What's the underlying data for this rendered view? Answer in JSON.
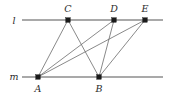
{
  "figure": {
    "type": "euclidean-geometry-diagram",
    "width": 170,
    "height": 95,
    "background_color": "#ffffff",
    "line_color": "#8c8c8c",
    "segment_color": "#6b6b6b",
    "point_color": "#1a1a1a",
    "label_color": "#2b2b2b"
  },
  "lines": [
    {
      "id": "l",
      "label": "l",
      "label_x": 14,
      "label_y": 24,
      "x1": 22,
      "y1": 20,
      "x2": 163,
      "y2": 20
    },
    {
      "id": "m",
      "label": "m",
      "label_x": 14,
      "label_y": 80,
      "x1": 22,
      "y1": 77,
      "x2": 163,
      "y2": 77
    }
  ],
  "points": [
    {
      "id": "A",
      "label": "A",
      "x": 38,
      "y": 77,
      "label_x": 38,
      "label_y": 92,
      "on_line": "m"
    },
    {
      "id": "B",
      "label": "B",
      "x": 99,
      "y": 77,
      "label_x": 99,
      "label_y": 92,
      "on_line": "m"
    },
    {
      "id": "C",
      "label": "C",
      "x": 68,
      "y": 20,
      "label_x": 68,
      "label_y": 12,
      "on_line": "l"
    },
    {
      "id": "D",
      "label": "D",
      "x": 114,
      "y": 20,
      "label_x": 114,
      "label_y": 12,
      "on_line": "l"
    },
    {
      "id": "E",
      "label": "E",
      "x": 145,
      "y": 20,
      "label_x": 145,
      "label_y": 12,
      "on_line": "l"
    }
  ],
  "segments": [
    {
      "id": "AC",
      "from": "A",
      "to": "C",
      "x1": 38,
      "y1": 77,
      "x2": 68,
      "y2": 20
    },
    {
      "id": "AD",
      "from": "A",
      "to": "D",
      "x1": 38,
      "y1": 77,
      "x2": 114,
      "y2": 20
    },
    {
      "id": "AE",
      "from": "A",
      "to": "E",
      "x1": 38,
      "y1": 77,
      "x2": 145,
      "y2": 20
    },
    {
      "id": "BC",
      "from": "B",
      "to": "C",
      "x1": 99,
      "y1": 77,
      "x2": 68,
      "y2": 20
    },
    {
      "id": "BD",
      "from": "B",
      "to": "D",
      "x1": 99,
      "y1": 77,
      "x2": 114,
      "y2": 20
    },
    {
      "id": "BE",
      "from": "B",
      "to": "E",
      "x1": 99,
      "y1": 77,
      "x2": 145,
      "y2": 20
    }
  ]
}
